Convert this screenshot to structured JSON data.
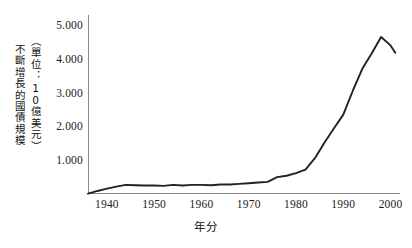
{
  "chart_data": {
    "type": "line",
    "title": "",
    "ylabel": "不斷增長的國債規模",
    "ylabel_units": "（單位：10億美元）",
    "xlabel": "年分",
    "ylim": [
      0,
      5.3
    ],
    "xlim": [
      1936,
      2002
    ],
    "grid": false,
    "legend": null,
    "ytick_labels": [
      "1.000",
      "2.000",
      "3.000",
      "4.000",
      "5.000"
    ],
    "ytick_values": [
      1,
      2,
      3,
      4,
      5
    ],
    "xtick_labels": [
      "1940",
      "1950",
      "1960",
      "1970",
      "1980",
      "1990",
      "2000",
      "2002"
    ],
    "xtick_values": [
      1940,
      1950,
      1960,
      1970,
      1980,
      1990,
      2000,
      2010
    ],
    "series": [
      {
        "name": "國債規模",
        "color": "#222222",
        "x": [
          1936,
          1938,
          1940,
          1942,
          1944,
          1946,
          1948,
          1950,
          1952,
          1954,
          1956,
          1958,
          1960,
          1962,
          1964,
          1966,
          1968,
          1970,
          1972,
          1974,
          1976,
          1978,
          1980,
          1982,
          1984,
          1986,
          1988,
          1990,
          1992,
          1994,
          1996,
          1998,
          2000,
          2001
        ],
        "values": [
          0.01,
          0.09,
          0.16,
          0.22,
          0.27,
          0.26,
          0.25,
          0.25,
          0.24,
          0.27,
          0.25,
          0.27,
          0.27,
          0.26,
          0.28,
          0.28,
          0.3,
          0.32,
          0.34,
          0.36,
          0.5,
          0.54,
          0.62,
          0.72,
          1.06,
          1.52,
          1.94,
          2.35,
          3.05,
          3.7,
          4.16,
          4.65,
          4.4,
          4.18
        ]
      }
    ]
  }
}
